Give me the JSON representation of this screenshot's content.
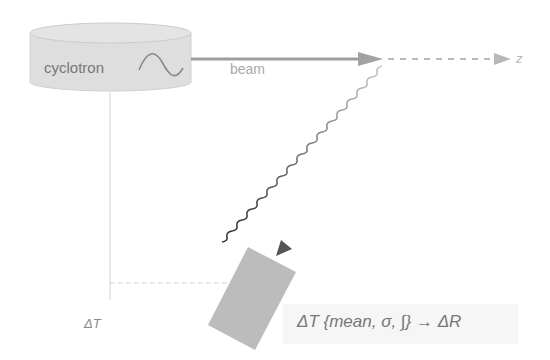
{
  "diagram": {
    "source": {
      "label": "cyclotron",
      "icon": "sine-wave-icon",
      "fill_color": "#dcdcdc",
      "stroke_color": "#c4c4c4"
    },
    "beam": {
      "label": "beam",
      "color": "#9a9a9a",
      "axis_label": "z",
      "axis_style": "dashed"
    },
    "photon": {
      "style": "wavy",
      "color": "#4a4a4a",
      "from": "beam-target",
      "to": "detector"
    },
    "detector": {
      "fill_color": "#bdbdbd",
      "shape": "rotated-rectangle"
    },
    "timing": {
      "label": "ΔT",
      "line_color": "#cfcfcf"
    },
    "equation": {
      "text": "ΔT {mean, σ, ∫} → ΔR"
    }
  }
}
